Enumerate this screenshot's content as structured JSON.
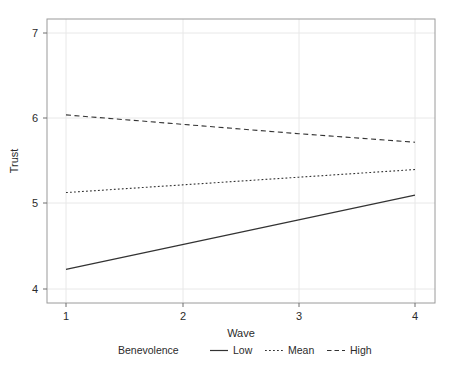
{
  "chart_data": {
    "type": "line",
    "title": "",
    "xlabel": "Wave",
    "ylabel": "Trust",
    "x": [
      1,
      2,
      3,
      4
    ],
    "xtick_labels": [
      "1",
      "2",
      "3",
      "4"
    ],
    "ytick_labels": [
      "4",
      "5",
      "6",
      "7"
    ],
    "xlim": [
      1,
      4
    ],
    "ylim": [
      4,
      7
    ],
    "grid": true,
    "legend_position": "bottom",
    "legend_title": "Benevolence",
    "series": [
      {
        "name": "Low",
        "style": "solid",
        "color": "#333333",
        "values": [
          4.23,
          4.52,
          4.81,
          5.1
        ]
      },
      {
        "name": "Mean",
        "style": "dotted",
        "color": "#333333",
        "values": [
          5.13,
          5.22,
          5.31,
          5.4
        ]
      },
      {
        "name": "High",
        "style": "dashed",
        "color": "#333333",
        "values": [
          6.04,
          5.93,
          5.82,
          5.72
        ]
      }
    ]
  },
  "axes": {
    "y_title": "Trust",
    "x_title": "Wave",
    "x_ticks": [
      "1",
      "2",
      "3",
      "4"
    ],
    "y_ticks": [
      "7",
      "6",
      "5",
      "4"
    ]
  },
  "legend": {
    "title": "Benevolence",
    "entries": [
      {
        "label": "Low",
        "style": "solid"
      },
      {
        "label": "Mean",
        "style": "dotted"
      },
      {
        "label": "High",
        "style": "dashed"
      }
    ]
  },
  "colors": {
    "line": "#333333",
    "grid": "#e8e8e8",
    "frame": "#9a9a9a",
    "text": "#2b2b2b",
    "background": "#ffffff"
  }
}
